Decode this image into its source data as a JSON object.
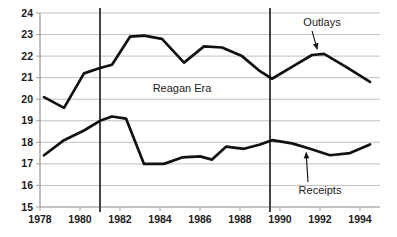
{
  "chart_data": {
    "type": "line",
    "title": "",
    "subtitle": "",
    "xlabel": "",
    "ylabel": "",
    "xlim": [
      1978,
      1995
    ],
    "ylim": [
      15,
      24
    ],
    "grid": true,
    "legend_position": "inline-annotation",
    "y_ticks": [
      15,
      16,
      17,
      18,
      19,
      20,
      21,
      22,
      23,
      24
    ],
    "y_tick_labels": [
      "15",
      "16",
      "17",
      "18",
      "19",
      "20",
      "21",
      "22",
      "23",
      "24"
    ],
    "x_ticks": [
      1978,
      1980,
      1982,
      1984,
      1986,
      1988,
      1990,
      1992,
      1994
    ],
    "x_tick_labels": [
      "1978",
      "1980",
      "1982",
      "1984",
      "1986",
      "1988",
      "1990",
      "1992",
      "1994"
    ],
    "series": [
      {
        "name": "Outlays",
        "color": "#111111",
        "x": [
          1978.2,
          1979.2,
          1980.2,
          1981.0,
          1981.6,
          1982.5,
          1983.2,
          1984.1,
          1985.2,
          1986.2,
          1987.1,
          1988.1,
          1989.0,
          1989.6,
          1990.6,
          1991.6,
          1992.2,
          1993.3,
          1994.5
        ],
        "values": [
          20.1,
          19.6,
          21.2,
          21.45,
          21.6,
          22.9,
          22.95,
          22.8,
          21.7,
          22.45,
          22.4,
          22.0,
          21.3,
          20.95,
          21.5,
          22.05,
          22.1,
          21.5,
          20.8
        ]
      },
      {
        "name": "Receipts",
        "color": "#111111",
        "x": [
          1978.2,
          1979.2,
          1980.2,
          1981.0,
          1981.6,
          1982.3,
          1983.2,
          1984.2,
          1985.1,
          1986.0,
          1986.6,
          1987.3,
          1988.2,
          1989.0,
          1989.6,
          1990.6,
          1991.5,
          1992.5,
          1993.5,
          1994.5
        ],
        "values": [
          17.4,
          18.1,
          18.55,
          19.0,
          19.2,
          19.1,
          17.0,
          17.0,
          17.3,
          17.35,
          17.2,
          17.8,
          17.7,
          17.9,
          18.1,
          17.95,
          17.7,
          17.4,
          17.5,
          17.9
        ]
      }
    ],
    "annotations": [
      {
        "text": "Reagan Era",
        "x": 1985.1,
        "y": 20.35,
        "kind": "era-label"
      },
      {
        "text": "Outlays",
        "x": 1992.1,
        "y": 23.4,
        "kind": "series-label",
        "arrow_to": [
          1991.9,
          22.2
        ]
      },
      {
        "text": "Receipts",
        "x": 1992.0,
        "y": 15.6,
        "kind": "series-label",
        "arrow_to": [
          1991.3,
          17.65
        ]
      }
    ],
    "era_dividers": [
      {
        "name": "reagan-era-start",
        "x": 1981.0
      },
      {
        "name": "reagan-era-end",
        "x": 1989.5
      }
    ],
    "colors": {
      "line": "#111111",
      "grid": "#b9b9b9",
      "axis": "#8a8a8a",
      "divider": "#3a3a3a",
      "background": "#ffffff",
      "text": "#1b1b1b"
    }
  }
}
